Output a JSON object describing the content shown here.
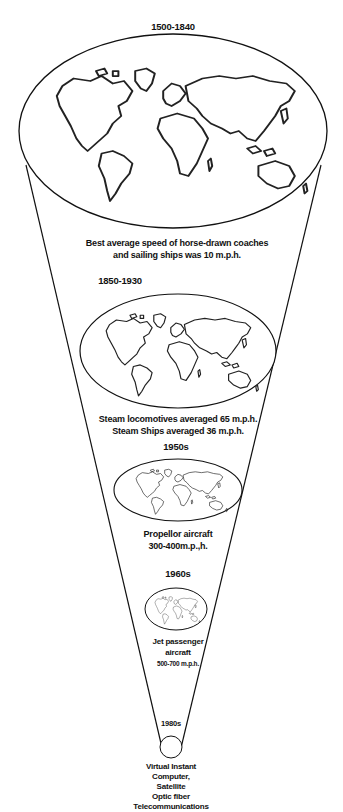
{
  "diagram": {
    "type": "shrinking-world cone",
    "stages": [
      {
        "era": "1500-1840",
        "caption": [
          "Best average speed of horse-drawn coaches",
          "and sailing ships was 10 m.p.h."
        ]
      },
      {
        "era": "1850-1930",
        "caption": [
          "Steam locomotives averaged 65 m.p.h.",
          "Steam Ships averaged 36 m.p.h."
        ]
      },
      {
        "era": "1950s",
        "caption": [
          "Propellor aircraft",
          "300-400m.p.,h."
        ]
      },
      {
        "era": "1960s",
        "caption": [
          "Jet passenger",
          "aircraft",
          "500-700 m.p.h."
        ]
      },
      {
        "era": "1980s",
        "caption": [
          "Virtual Instant",
          "Computer,",
          "Satellite",
          "Optic fiber",
          "Telecommunications"
        ]
      }
    ],
    "colors": {
      "line": "#111111",
      "background": "#ffffff"
    }
  }
}
